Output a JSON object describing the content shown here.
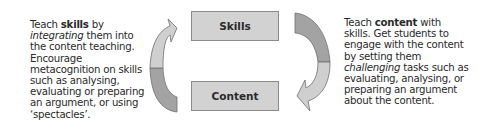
{
  "boxes": {
    "skills": "Skills",
    "content": "Content"
  },
  "left_text": {
    "p1": "Teach ",
    "bold": "skills",
    "p2": " by ",
    "italic": "integrating",
    "p3": " them into the content teaching. Encourage metacognition on skills such as analysing, evaluating or preparing an argument, or using ‘spectacles’."
  },
  "right_text": {
    "p1": "Teach ",
    "bold": "content",
    "p2": " with skills. Get students to engage with the content by setting them ",
    "italic": "challenging",
    "p3": " tasks such as evaluating, analysing, or preparing an argument about the content."
  },
  "colors": {
    "box_fill": "#d2d2d2",
    "box_border": "#8a8a8a",
    "arrow_light": "#cfcfcf",
    "arrow_dark": "#a3a3a3",
    "arrow_stroke": "#6e6e6e"
  }
}
